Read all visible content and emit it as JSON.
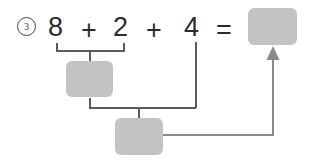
{
  "worksheet": {
    "item_number": "3",
    "equation": {
      "tokens": [
        {
          "text": "8",
          "x": 48,
          "y": 14
        },
        {
          "text": "+",
          "x": 81,
          "y": 17
        },
        {
          "text": "2",
          "x": 113,
          "y": 14
        },
        {
          "text": "+",
          "x": 146,
          "y": 17
        },
        {
          "text": "4",
          "x": 184,
          "y": 14
        },
        {
          "text": "=",
          "x": 216,
          "y": 17
        }
      ]
    },
    "answer_box": {
      "label": "",
      "x": 248,
      "y": 8,
      "width": 49,
      "height": 37
    },
    "partial_sum_boxes": [
      {
        "name": "first-partial-sum-box",
        "label": "",
        "x": 66,
        "y": 61,
        "width": 47,
        "height": 36
      },
      {
        "name": "second-partial-sum-box",
        "label": "",
        "x": 115,
        "y": 118,
        "width": 48,
        "height": 37
      }
    ],
    "colors": {
      "box_fill": "#c3c3c3",
      "line": "#5b5b5b",
      "text": "#2b2b2b"
    },
    "connectors": {
      "bracket_top": {
        "left_x": 57,
        "right_x": 124,
        "bar_y": 51,
        "tick_top_y": 43,
        "stub_x": 90,
        "stub_bottom_y": 61
      },
      "bracket_bottom": {
        "left_x": 90,
        "right_x": 196,
        "bar_y": 108,
        "tick_top_y": 98,
        "stub_x": 139,
        "stub_bottom_y": 118
      },
      "four_drop": {
        "x": 196,
        "top_y": 42,
        "bottom_y": 108
      },
      "answer_arrow": {
        "start_x": 163,
        "horizontal_y": 135,
        "turn_x": 273,
        "arrow_tip_y": 52
      }
    }
  }
}
